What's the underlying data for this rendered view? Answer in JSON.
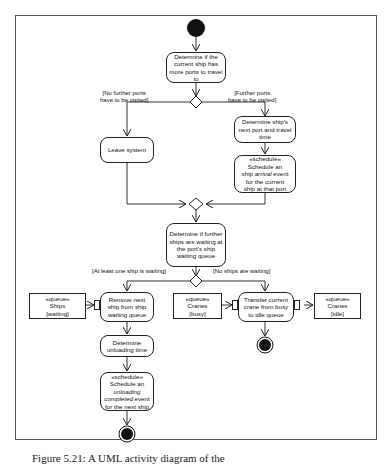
{
  "diagram": {
    "type": "UML activity diagram",
    "nodes": {
      "check_ports": "Determine if the current ship has more ports to travel to",
      "next_port": "Determine ship's next port and travel time",
      "leave": "Leave system",
      "schedule_arrival": {
        "stereotype": "«schedule»",
        "line1": "Schedule an",
        "line2_pre": "ship ",
        "line2_em": "arrival",
        "line2_post": " event",
        "line3": "for the current",
        "line4": "ship at that port"
      },
      "check_waiting": "Determine if further ships are waiting at the port's ship waiting queue",
      "remove_ship": "Remove next ship from ship waiting queue",
      "unloading_time": "Determine unloading time",
      "schedule_unloading": {
        "stereotype": "«schedule»",
        "line1": "Schedule an",
        "line2_em": "unloading completed",
        "line3": " event",
        "line4": "for the next ship"
      },
      "transfer_crane": "Transfer current crane from busy to idle queue"
    },
    "objects": {
      "ships_waiting": {
        "stereotype": "«queue»",
        "name": "Ships",
        "state": "[waiting]"
      },
      "cranes_busy": {
        "stereotype": "«queue»",
        "name": "Cranes",
        "state": "[busy]"
      },
      "cranes_idle": {
        "stereotype": "«queue»",
        "name": "Cranes",
        "state": "[idle]"
      }
    },
    "guards": {
      "no_further_ports": "[No further ports have to be visited]",
      "no_further_1": "[No further ports",
      "no_further_2": "have to be visited]",
      "further_1": "[Further ports",
      "further_2": "have to be visited]",
      "at_least_one": "[At least one ship is waiting]",
      "no_ships": "[No ships are waiting]"
    }
  },
  "caption": "Figure 5.21: A UML activity diagram of the"
}
